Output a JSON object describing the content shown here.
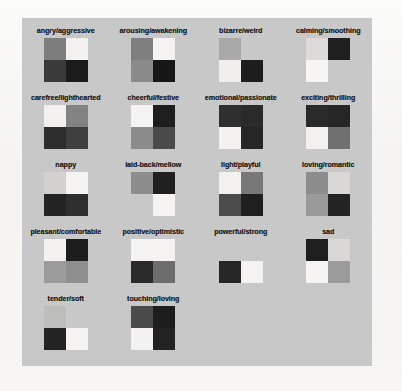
{
  "page": {
    "background_color": "#f7f6f4",
    "panel_background_color": "#c8c8c8"
  },
  "legend": {
    "transparent_note": "empty quadrant shows panel background"
  },
  "chart_data": {
    "type": "heatmap",
    "xlabel": "",
    "ylabel": "",
    "grid": false,
    "legend_position": "none",
    "columns": 4,
    "rows": 5,
    "swatch_layout": "2x2 quadrants: top-left, top-right, bottom-left, bottom-right",
    "background_color": "#c8c8c8",
    "categories": [
      "angry/aggressive",
      "arousing/awakening",
      "bizarre/weird",
      "calming/smoothing",
      "carefree/lighthearted",
      "cheerful/festive",
      "emotional/passionate",
      "exciting/thrilling",
      "nappy",
      "laid-back/mellow",
      "light/playful",
      "loving/romantic",
      "pleasant/comfortable",
      "positive/optimistic",
      "powerful/strong",
      "sad",
      "tender/soft",
      "touching/loving"
    ],
    "palettes": [
      {
        "label": "angry/aggressive",
        "quadrants": [
          "#7d7d7d",
          "#f2f1ef",
          "#3a3a3a",
          "#1b1b1b"
        ]
      },
      {
        "label": "arousing/awakening",
        "quadrants": [
          "#7f7f7f",
          "#f4f3f1",
          "#8a8a8a",
          "#161616"
        ]
      },
      {
        "label": "bizarre/weird",
        "quadrants": [
          "#a9a9a9",
          "#c8c8c8",
          "#f0efed",
          "#1d1d1d"
        ]
      },
      {
        "label": "calming/smoothing",
        "quadrants": [
          "#dcdbd9",
          "#1f1f1f",
          "#f6f5f3",
          "#c8c8c8"
        ]
      },
      {
        "label": "carefree/lighthearted",
        "quadrants": [
          "#f2f1ef",
          "#838383",
          "#2d2d2d",
          "#3f3f3f"
        ]
      },
      {
        "label": "cheerful/festive",
        "quadrants": [
          "#f4f3f1",
          "#1e1e1e",
          "#8b8b8b",
          "#4a4a4a"
        ]
      },
      {
        "label": "emotional/passionate",
        "quadrants": [
          "#2f2f2f",
          "#2a2a2a",
          "#f3f2f0",
          "#262626"
        ]
      },
      {
        "label": "exciting/thrilling",
        "quadrants": [
          "#2a2a2a",
          "#262626",
          "#f2f1ef",
          "#6f6f6f"
        ]
      },
      {
        "label": "nappy",
        "quadrants": [
          "#d2d1cf",
          "#f4f3f1",
          "#242424",
          "#2e2e2e"
        ]
      },
      {
        "label": "laid-back/mellow",
        "quadrants": [
          "#8d8d8d",
          "#202020",
          "#c8c8c8",
          "#f5f4f2"
        ]
      },
      {
        "label": "light/playful",
        "quadrants": [
          "#f2f1ef",
          "#787878",
          "#4c4c4c",
          "#1f1f1f"
        ]
      },
      {
        "label": "loving/romantic",
        "quadrants": [
          "#8d8d8d",
          "#d9d8d6",
          "#9a9a9a",
          "#242424"
        ]
      },
      {
        "label": "pleasant/comfortable",
        "quadrants": [
          "#f3f2f0",
          "#1d1d1d",
          "#9b9b9b",
          "#8e8e8e"
        ]
      },
      {
        "label": "positive/optimistic",
        "quadrants": [
          "#f4f3f1",
          "#f4f3f1",
          "#2a2a2a",
          "#6d6d6d"
        ]
      },
      {
        "label": "powerful/strong",
        "quadrants": [
          "#c8c8c8",
          "#c8c8c8",
          "#262626",
          "#f4f3f1"
        ]
      },
      {
        "label": "sad",
        "quadrants": [
          "#1e1e1e",
          "#d9d8d6",
          "#f5f4f2",
          "#9b9b9b"
        ]
      },
      {
        "label": "tender/soft",
        "quadrants": [
          "#bdbdbb",
          "#c8c8c8",
          "#242424",
          "#f4f3f1"
        ]
      },
      {
        "label": "touching/loving",
        "quadrants": [
          "#4b4b4b",
          "#1d1d1d",
          "#f3f2f0",
          "#222222"
        ]
      }
    ]
  }
}
